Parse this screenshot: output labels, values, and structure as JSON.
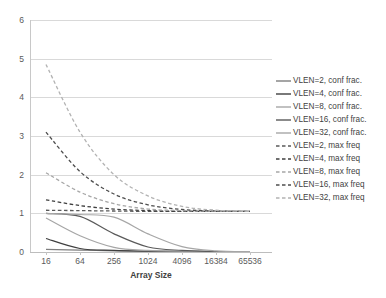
{
  "chart_data": {
    "type": "line",
    "title": "",
    "xlabel": "Array Size",
    "ylabel": "",
    "xscale": "log2",
    "x": [
      16,
      64,
      256,
      1024,
      4096,
      16384,
      65536
    ],
    "xtick_labels": [
      "16",
      "64",
      "256",
      "1024",
      "4096",
      "16384",
      "65536"
    ],
    "ytick_labels": [
      "0",
      "1",
      "2",
      "3",
      "4",
      "5",
      "6"
    ],
    "ylim": [
      0,
      6
    ],
    "grid": "horizontal",
    "legend_position": "right",
    "series": [
      {
        "name": "VLEN=2, conf frac.",
        "style": "solid",
        "color": "#7f7f7f",
        "values": [
          0.07,
          0.05,
          0.03,
          0.02,
          0.01,
          0.0,
          0.0
        ]
      },
      {
        "name": "VLEN=4, conf frac.",
        "style": "solid",
        "color": "#3f3f3f",
        "values": [
          0.35,
          0.09,
          0.04,
          0.02,
          0.01,
          0.0,
          0.0
        ]
      },
      {
        "name": "VLEN=8, conf frac.",
        "style": "solid",
        "color": "#a6a6a6",
        "values": [
          0.88,
          0.42,
          0.12,
          0.04,
          0.02,
          0.01,
          0.0
        ]
      },
      {
        "name": "VLEN=16, conf frac.",
        "style": "solid",
        "color": "#5a5a5a",
        "values": [
          1.0,
          0.92,
          0.47,
          0.13,
          0.04,
          0.01,
          0.0
        ]
      },
      {
        "name": "VLEN=32, conf frac.",
        "style": "solid",
        "color": "#a6a6a6",
        "values": [
          1.0,
          0.97,
          0.9,
          0.47,
          0.14,
          0.03,
          0.01
        ]
      },
      {
        "name": "VLEN=2, max freq",
        "style": "dashed",
        "color": "#595959",
        "values": [
          1.08,
          1.07,
          1.06,
          1.05,
          1.05,
          1.05,
          1.05
        ]
      },
      {
        "name": "VLEN=4, max freq",
        "style": "dashed",
        "color": "#3f3f3f",
        "values": [
          1.35,
          1.2,
          1.11,
          1.07,
          1.05,
          1.05,
          1.05
        ]
      },
      {
        "name": "VLEN=8, max freq",
        "style": "dashed",
        "color": "#a6a6a6",
        "values": [
          2.05,
          1.55,
          1.25,
          1.11,
          1.07,
          1.05,
          1.05
        ]
      },
      {
        "name": "VLEN=16, max freq",
        "style": "dashed",
        "color": "#4d4d4d",
        "values": [
          3.1,
          2.08,
          1.5,
          1.22,
          1.1,
          1.06,
          1.05
        ]
      },
      {
        "name": "VLEN=32, max freq",
        "style": "dashed",
        "color": "#b3b3b3",
        "values": [
          4.85,
          3.1,
          2.0,
          1.45,
          1.18,
          1.08,
          1.05
        ]
      }
    ]
  },
  "colors": {
    "gridline": "#d9d9d9",
    "axis": "#c8c8c8",
    "tick_text": "#5a5a5a",
    "legend_text": "#3f3f3f",
    "background": "#ffffff"
  }
}
